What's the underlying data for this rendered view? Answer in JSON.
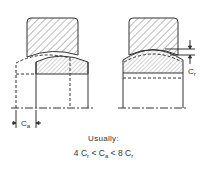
{
  "diagram": {
    "type": "bearing misalignment clearance schematic",
    "left_figure": {
      "description": "Axial clearance: inner ring shown shifted axially (dashed outline)",
      "dimension_label": "C",
      "dimension_sub": "a"
    },
    "right_figure": {
      "description": "Radial clearance between outer ring and inner ring",
      "dimension_label": "C",
      "dimension_sub": "r"
    },
    "caption": {
      "line1": "Usually:",
      "line2_parts": [
        "4 C",
        "r",
        " < C",
        "a",
        " < 8 C",
        "r"
      ]
    },
    "colors": {
      "line": "#333333",
      "background": "#ffffff"
    }
  }
}
